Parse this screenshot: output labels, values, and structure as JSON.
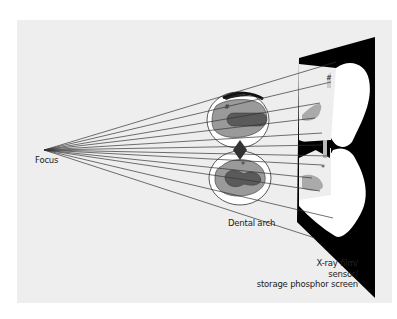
{
  "figure": {
    "labels": {
      "focus": "Focus",
      "dental_arch": "Dental arch",
      "film_line1": "X-ray film/",
      "film_line2": "sensor/",
      "film_line3": "storage phosphor screen"
    },
    "markers": {
      "upper_hash": "#",
      "upper_film_hash": "#",
      "lower_star": "*",
      "lower_film_star": "*"
    },
    "colors": {
      "background_panel": "#eeeeee",
      "film": "#000000",
      "tooth_white": "#ffffff",
      "enamel_gray": "#9a9a9a",
      "pulp_dark": "#5a5a5a",
      "ray_line": "#333333"
    }
  }
}
